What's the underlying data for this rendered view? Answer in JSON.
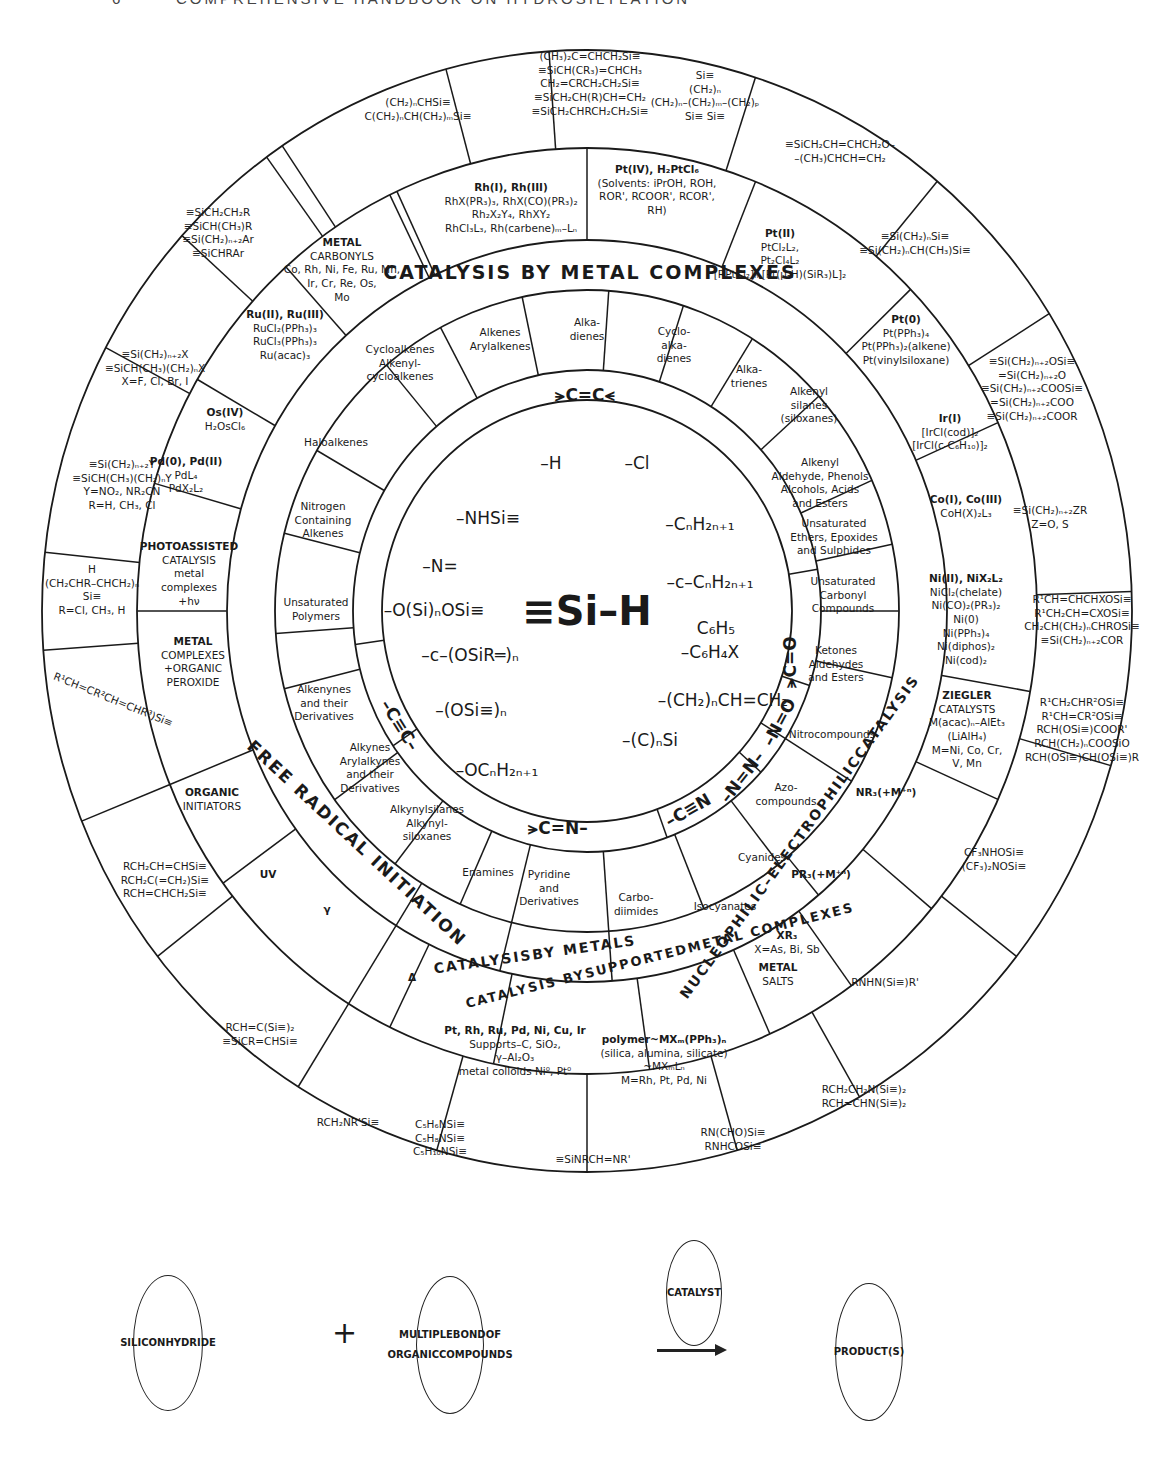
{
  "header": {
    "page_number": "6",
    "title": "COMPREHENSIVE HANDBOOK ON HYDROSILYLATION"
  },
  "center": {
    "title": "≡Si–H",
    "substituents": [
      "–H",
      "–Cl",
      "–NHSi≡",
      "–CₙH₂ₙ₊₁",
      "–N=",
      "–c–CₙH₂ₙ₊₁",
      "–O(Si)ₙOSi≡",
      "C₆H₅",
      "–c–(OSiR═)ₙ",
      "–C₆H₄X",
      "–(CH₂)ₙCH=CH₂",
      "–(OSi≡)ₙ",
      "–(C)ₙSi",
      "–OCₙH₂ₙ₊₁"
    ]
  },
  "bond_types": {
    "c_c_double": "⪫C=C⪪",
    "c_c_triple": "–C≡C–",
    "c_n_double": "⪫C=N–",
    "c_n_triple": "–C≡N",
    "n_n_double": "–N=N–",
    "n_o_double": "–N=O",
    "c_o_double": "⪫C=O"
  },
  "substrates": [
    "Alkenes|Arylalkenes",
    "Alka-|dienes",
    "Cyclo-|alka-|dienes",
    "Alka-|trienes",
    "Alkenyl|silanes|(siloxanes)",
    "Alkenyl|Aldehyde, Phenols|Alcohols, Acids|and Esters",
    "Unsaturated|Ethers, Epoxides|and Sulphides",
    "Unsaturated|Carbonyl|Compounds",
    "Ketones|Aldehydes|and Esters",
    "Nitrocompounds",
    "Azo-|compounds",
    "Cyanides",
    "Isocyanates",
    "Carbo-|diimides",
    "Pyridine|and|Derivatives",
    "Enamines",
    "Alkynylsilanes|Alkynyl-|siloxanes",
    "Alkynes|Arylalkynes|and their|Derivatives",
    "Alkenynes|and their|Derivatives",
    "Unsaturated|Polymers",
    "Nitrogen|Containing|Alkenes",
    "Haloalkenes",
    "Cycloalkenes|Alkenyl-|cycloalkenes"
  ],
  "catalysis_bands": {
    "metal_complexes": "CATALYSIS BY METAL COMPLEXES",
    "free_radical": "FREE RADICAL INITIATION",
    "by_metals": "CATALYSIS|BY METALS",
    "supported": "CATALYSIS BY|SUPPORTED|METAL COMPLEXES",
    "nucleophilic": "NUCLEOPHILIC–ELECTROPHILIC|CATALYSIS"
  },
  "catalysts": [
    "METAL|CARBONYLS|Co, Rh, Ni, Fe, Ru, Mn,|Ir, Cr, Re, Os,|Mo",
    "Rh(I), Rh(III)|RhX(PR₃)₃, RhX(CO)(PR₃)₂|Rh₂X₂Y₄, RhXY₂|RhCl₃L₃, Rh(carbene)ₘ–Lₙ",
    "Pt(IV), H₂PtCl₆|(Solvents: iPrOH, ROH,|ROR', RCOOR', RCOR',|RH)",
    "Pt(II)|PtCl₂L₂,|Pt₂Cl₄L₂|[RPtCl₂]ₙ,[Pt(μ-H)(SiR₃)L]₂",
    "Pt(0)|Pt(PPh₃)₄|Pt(PPh₃)₂(alkene)|Pt(vinylsiloxane)",
    "Ir(I)|[IrCl(cod)]₂|[IrCl(c-C₆H₁₀)]₂",
    "Co(I), Co(III)|CoH(X)₂L₃",
    "Ni(II), NiX₂L₂|NiCl₂(chelate)|Ni(CO)₂(PR₃)₂|Ni(0)|Ni(PPh₃)₄|Ni(diphos)₂|Ni(cod)₂",
    "ZIEGLER|CATALYSTS|M(acac)ₙ–AlEt₃|(LiAlH₄)|M=Ni, Co, Cr,|V, Mn",
    "NR₃(+M⁺ⁿ)",
    "PR₃(+M⁺ⁿ)",
    "XR₃|X=As, Bi, Sb",
    "METAL|SALTS",
    "polymer~MXₘ(PPh₃)ₙ|(silica, alumina, silicate)|~MXₘLₙ|M=Rh, Pt, Pd, Ni",
    "Pt, Rh, Ru, Pd, Ni, Cu, Ir|Supports–C, SiO₂,|γ–Al₂O₃|metal colloids Ni⁰, Pt⁰",
    "Δ",
    "γ",
    "UV",
    "ORGANIC|INITIATORS",
    "METAL|COMPLEXES|+ORGANIC|PEROXIDE",
    "PHOTOASSISTED|CATALYSIS|metal|complexes|+hν",
    "Pd(0), Pd(II)|PdL₄|PdX₂L₂",
    "Os(IV)|H₂OsCl₆",
    "Ru(II), Ru(III)|RuCl₂(PPh₃)₃|RuCl₃(PPh₃)₃|Ru(acac)₃"
  ],
  "products": [
    "(CH₂)ₙCHSi≡|C(CH₂)ₙCH(CH₂)ₘSi≡",
    "(CH₃)₂C=CHCH₂Si≡|≡SiCH(CR₃)=CHCH₃|CH₂=CRCH₂CH₂Si≡|≡SiCH₂CH(R)CH=CH₂|≡SiCH₂CHRCH₂CH₂Si≡",
    "Si≡|(CH₂)ₙ|(CH₂)ₙ–(CH₂)ₘ–(CH₂)ₚ|Si≡   Si≡",
    "≡SiCH₂CH=CHCH₂O–|–(CH₃)CHCH=CH₂",
    "≡Si(CH₂)ₙSi≡|≡Si(CH₂)ₙCH(CH₃)Si≡",
    "≡Si(CH₂)ₙ₊₂OSi≡|=Si(CH₂)ₙ₊₂O|≡Si(CH₂)ₙ₊₂COOSi≡|=Si(CH₂)ₙ₊₂COO|≡Si(CH₂)ₙ₊₂COOR",
    "≡Si(CH₂)ₙ₊₂ZR|Z=O, S",
    "R¹CH=CHCHXOSi≡|R¹CH₂CH=CXOSi≡|CH₂CH(CH₂)ₙCHROSi≡|≡Si(CH₂)ₙ₊₂COR",
    "R¹CH₂CHR²OSi≡|R¹CH=CR²OSi≡|RCH(OSi≡)COOR'|RCH(CH₂)ₙCOOSiO|RCH(OSi≡)CH(OSi≡)R",
    "CF₃NHOSi≡|(CF₃)₂NOSi≡",
    "RNHN(Si≡)R'",
    "RCH₂CH₂N(Si≡)₂|RCH=CHN(Si≡)₂",
    "RN(CHO)Si≡|RNHCOSi≡",
    "≡SiNRCH=NR'",
    "C₅H₆NSi≡|C₅H₈NSi≡|C₅H₁₀NSi≡",
    "RCH₂NR'Si≡",
    "RCH=C(Si≡)₂|≡SiCR=CHSi≡",
    "RCH₂CH=CHSi≡|RCH₂C(=CH₂)Si≡|RCH=CHCH₂Si≡",
    "R¹CH=CR²CH=CHR³)Si≡",
    "H|(CH₂CHR–CHCH₂)ₙ|Si≡|R=Cl, CH₃, H",
    "≡Si(CH₂)ₙ₊₂Y|≡SiCH(CH₃)(CH₂)ₙY|Y=NO₂, NR₂CN|R=H, CH₃, Cl",
    "≡Si(CH₂)ₙ₊₂X|≡SiCH(CH₃)(CH₂)ₙX|X=F, Cl, Br, I",
    "≡SiCH₂CH₂R|≡SiCH(CH₃)R|≡Si(CH₂)ₙ₊₂Ar|≡SiCHRAr"
  ],
  "scheme": {
    "reactant1": "SILICON|HYDRIDE",
    "plus": "+",
    "reactant2": "MULTIPLE|BOND|OF ORGANIC|COMPOUNDS",
    "catalyst": "CATALYST",
    "product": "PRODUCT(S)"
  }
}
